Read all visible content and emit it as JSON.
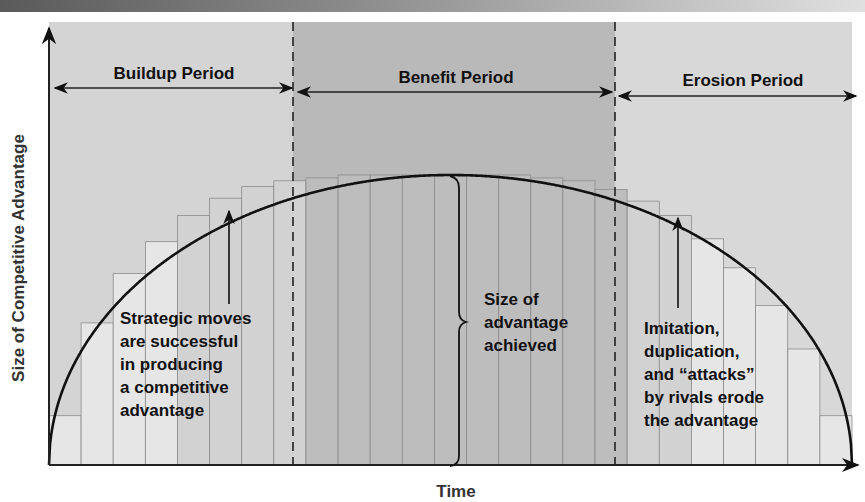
{
  "title_partial": "",
  "axes": {
    "x_label": "Time",
    "y_label": "Size of Competitive Advantage"
  },
  "periods": [
    {
      "name": "buildup",
      "label": "Buildup Period",
      "x_start": 49,
      "x_end": 293,
      "color": "#d4d4d4"
    },
    {
      "name": "benefit",
      "label": "Benefit Period",
      "x_start": 293,
      "x_end": 615,
      "color": "#b9b9b9"
    },
    {
      "name": "erosion",
      "label": "Erosion Period",
      "x_start": 615,
      "x_end": 852,
      "color": "#d8d8d8"
    }
  ],
  "annotations": {
    "buildup": [
      "Strategic moves",
      "are successful",
      "in producing",
      "a competitive",
      "advantage"
    ],
    "benefit": [
      "Size of",
      "advantage",
      "achieved"
    ],
    "erosion": [
      "Imitation,",
      "duplication,",
      "and “attacks”",
      "by rivals erode",
      "the advantage"
    ]
  },
  "colors": {
    "curve": "#111111",
    "bar_light": "#e6e6e6",
    "bar_mid": "#d2d2d2",
    "bar_dark": "#bdbdbd",
    "bar_line": "#8c8c8c",
    "divider": "#222222"
  },
  "chart_data": {
    "type": "area",
    "title": "",
    "xlabel": "Time",
    "ylabel": "Size of Competitive Advantage",
    "regions": [
      "Buildup Period",
      "Benefit Period",
      "Erosion Period"
    ],
    "bar_tops_relative": [
      0.17,
      0.49,
      0.66,
      0.77,
      0.86,
      0.92,
      0.96,
      0.98,
      0.99,
      1.0,
      1.0,
      1.0,
      1.0,
      1.0,
      1.0,
      0.99,
      0.98,
      0.95,
      0.91,
      0.86,
      0.78,
      0.68,
      0.55,
      0.4,
      0.17
    ],
    "grid": false,
    "legend": "none"
  }
}
